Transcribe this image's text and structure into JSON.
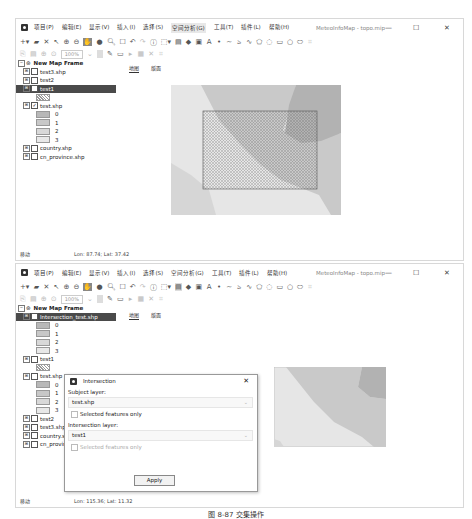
{
  "window1": {
    "menu": [
      "项目(P)",
      "编辑(E)",
      "显示(V)",
      "插入(I)",
      "选择(S)",
      "空间分析(G)",
      "工具(T)",
      "插件(L)",
      "帮助(H)"
    ],
    "active_menu_index": 5,
    "title": "MeteoInfoMap - topo.mip",
    "zoom_level": "100%",
    "legend": {
      "frame": "New Map Frame",
      "items": [
        {
          "label": "test3.shp",
          "type": "layer"
        },
        {
          "label": "test2",
          "type": "layer"
        },
        {
          "label": "test1",
          "type": "layer",
          "selected": true
        },
        {
          "label": "",
          "type": "hatch-swatch"
        },
        {
          "label": "test.shp",
          "type": "layer",
          "checked": true
        },
        {
          "label": "0",
          "type": "swatch",
          "color": "#b8b8b8"
        },
        {
          "label": "1",
          "type": "swatch",
          "color": "#c8c8c8"
        },
        {
          "label": "2",
          "type": "swatch",
          "color": "#d8d8d8"
        },
        {
          "label": "3",
          "type": "swatch",
          "color": "#e8e8e8"
        },
        {
          "label": "country.shp",
          "type": "layer"
        },
        {
          "label": "cn_province.shp",
          "type": "layer"
        }
      ]
    },
    "tabs": [
      "地图",
      "版面"
    ],
    "status": "移动",
    "coords": "Lon: 87.74; Lat: 37.42"
  },
  "window2": {
    "menu": [
      "项目(P)",
      "编辑(E)",
      "显示(V)",
      "插入(I)",
      "选择(S)",
      "空间分析(G)",
      "工具(T)",
      "插件(L)",
      "帮助(H)"
    ],
    "title": "MeteoInfoMap - topo.mip",
    "zoom_level": "100%",
    "legend": {
      "frame": "New Map Frame",
      "items": [
        {
          "label": "Intersection_test.shp",
          "type": "layer",
          "selected": true
        },
        {
          "label": "0",
          "type": "swatch",
          "color": "#b8b8b8"
        },
        {
          "label": "1",
          "type": "swatch",
          "color": "#c8c8c8"
        },
        {
          "label": "2",
          "type": "swatch",
          "color": "#d8d8d8"
        },
        {
          "label": "3",
          "type": "swatch",
          "color": "#e8e8e8"
        },
        {
          "label": "test1",
          "type": "layer"
        },
        {
          "label": "",
          "type": "hatch-swatch"
        },
        {
          "label": "test.shp",
          "type": "layer"
        },
        {
          "label": "0",
          "type": "swatch",
          "color": "#b8b8b8"
        },
        {
          "label": "1",
          "type": "swatch",
          "color": "#c8c8c8"
        },
        {
          "label": "2",
          "type": "swatch",
          "color": "#d8d8d8"
        },
        {
          "label": "3",
          "type": "swatch",
          "color": "#e8e8e8"
        },
        {
          "label": "test2",
          "type": "layer"
        },
        {
          "label": "test3.shp",
          "type": "layer"
        },
        {
          "label": "country.shp",
          "type": "layer"
        },
        {
          "label": "cn_province.shp",
          "type": "layer"
        }
      ]
    },
    "tabs": [
      "地图",
      "版面"
    ],
    "status": "移动",
    "coords": "Lon: 115.36; Lat: 11.32"
  },
  "dialog": {
    "title": "Intersection",
    "subject_label": "Subject layer:",
    "subject_value": "test.shp",
    "subject_selected_only": "Selected features only",
    "intersection_label": "Intersection layer:",
    "intersection_value": "test1",
    "intersection_selected_only": "Selected features only",
    "apply": "Apply"
  },
  "caption": "图 8-87  交集操作"
}
